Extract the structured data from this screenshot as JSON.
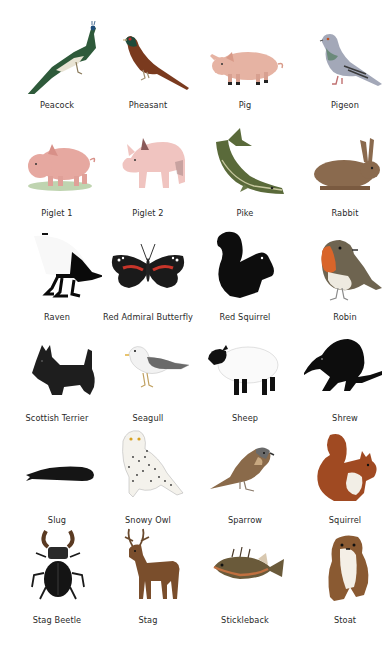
{
  "grid": {
    "columns": 4,
    "rows": 6,
    "items": [
      {
        "label": "Peacock",
        "icon": "peacock-icon"
      },
      {
        "label": "Pheasant",
        "icon": "pheasant-icon"
      },
      {
        "label": "Pig",
        "icon": "pig-icon"
      },
      {
        "label": "Pigeon",
        "icon": "pigeon-icon"
      },
      {
        "label": "Piglet 1",
        "icon": "piglet-icon"
      },
      {
        "label": "Piglet 2",
        "icon": "piglet-icon"
      },
      {
        "label": "Pike",
        "icon": "pike-icon"
      },
      {
        "label": "Rabbit",
        "icon": "rabbit-icon"
      },
      {
        "label": "Raven",
        "icon": "raven-icon"
      },
      {
        "label": "Red Admiral Butterfly",
        "icon": "butterfly-icon"
      },
      {
        "label": "Red Squirrel",
        "icon": "squirrel-icon"
      },
      {
        "label": "Robin",
        "icon": "robin-icon"
      },
      {
        "label": "Scottish Terrier",
        "icon": "terrier-icon"
      },
      {
        "label": "Seagull",
        "icon": "seagull-icon"
      },
      {
        "label": "Sheep",
        "icon": "sheep-icon"
      },
      {
        "label": "Shrew",
        "icon": "shrew-icon"
      },
      {
        "label": "Slug",
        "icon": "slug-icon"
      },
      {
        "label": "Snowy Owl",
        "icon": "owl-icon"
      },
      {
        "label": "Sparrow",
        "icon": "sparrow-icon"
      },
      {
        "label": "Squirrel",
        "icon": "squirrel-icon"
      },
      {
        "label": "Stag Beetle",
        "icon": "beetle-icon"
      },
      {
        "label": "Stag",
        "icon": "stag-icon"
      },
      {
        "label": "Stickleback",
        "icon": "fish-icon"
      },
      {
        "label": "Stoat",
        "icon": "stoat-icon"
      }
    ]
  }
}
